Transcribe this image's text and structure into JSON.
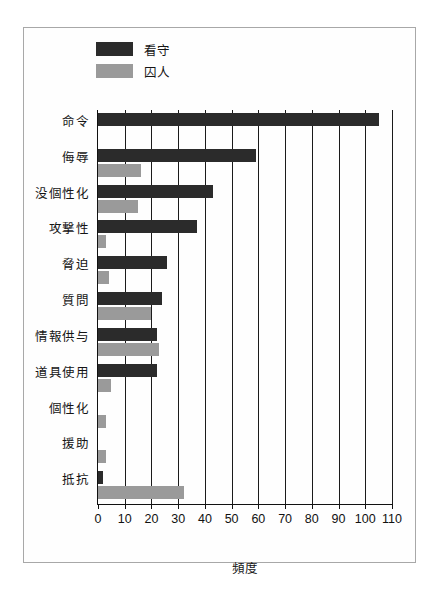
{
  "chart_data": {
    "type": "bar",
    "orientation": "horizontal",
    "title": "",
    "xlabel": "頻度",
    "ylabel": "",
    "xlim": [
      0,
      110
    ],
    "xticks": [
      0,
      10,
      20,
      30,
      40,
      50,
      60,
      70,
      80,
      90,
      100,
      110
    ],
    "grid": "vertical",
    "legend_position": "top-left",
    "categories": [
      "命令",
      "侮辱",
      "没個性化",
      "攻撃性",
      "脅迫",
      "質問",
      "情報供与",
      "道具使用",
      "個性化",
      "援助",
      "抵抗"
    ],
    "series": [
      {
        "name": "看守",
        "color": "#2b2b2b",
        "values": [
          105,
          59,
          43,
          37,
          26,
          24,
          22,
          22,
          0,
          0,
          2
        ]
      },
      {
        "name": "囚人",
        "color": "#9a9a9a",
        "values": [
          0,
          16,
          15,
          3,
          4,
          20,
          23,
          5,
          3,
          3,
          32
        ]
      }
    ]
  },
  "legend": {
    "items": [
      {
        "label": "看守",
        "color": "#2b2b2b"
      },
      {
        "label": "囚人",
        "color": "#9a9a9a"
      }
    ]
  },
  "axis": {
    "x_title": "頻度",
    "tick_labels": [
      "0",
      "10",
      "20",
      "30",
      "40",
      "50",
      "60",
      "70",
      "80",
      "90",
      "100",
      "110"
    ]
  },
  "colors": {
    "dark_series": "#2b2b2b",
    "light_series": "#9a9a9a",
    "axis": "#111111",
    "frame": "#a8a8a8",
    "background": "#ffffff"
  }
}
